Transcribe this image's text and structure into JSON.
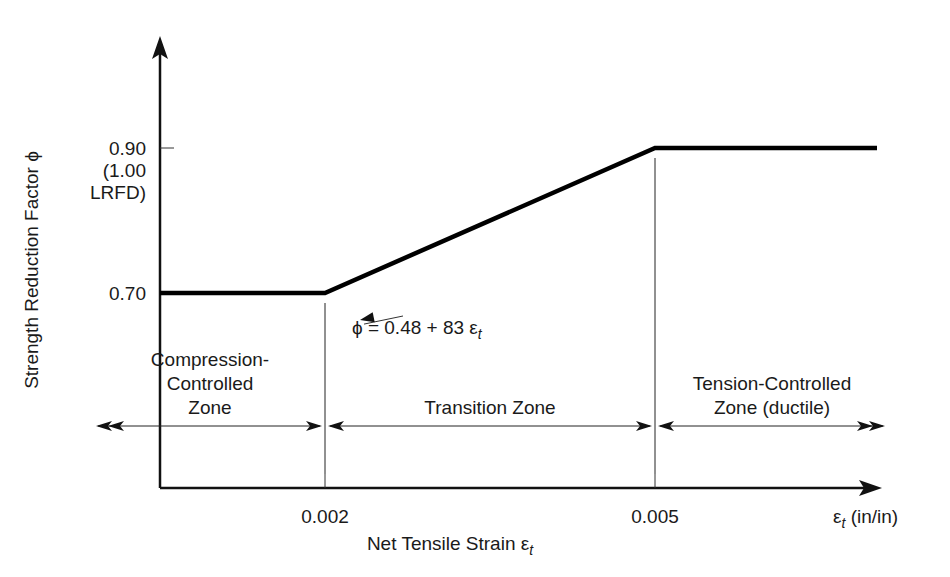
{
  "chart_data": {
    "type": "line",
    "title": "",
    "xlabel": "Net Tensile Strain ε",
    "xlabel_sub": "t",
    "x_axis_end_label": "ε",
    "x_axis_end_sub": "t",
    "x_axis_end_unit": " (in/in)",
    "ylabel": "Strength Reduction Factor ϕ",
    "xlim": [
      0,
      0.00675
    ],
    "ylim": [
      0.48,
      1.12
    ],
    "x_ticks": [
      {
        "value": 0.002,
        "label": "0.002"
      },
      {
        "value": 0.005,
        "label": "0.005"
      }
    ],
    "y_ticks": [
      {
        "value": 0.7,
        "label_lines": [
          "0.70"
        ]
      },
      {
        "value": 0.9,
        "label_lines": [
          "0.90",
          "(1.00",
          "LRFD)"
        ]
      }
    ],
    "series": [
      {
        "name": "Strength reduction factor",
        "x": [
          0.0,
          0.002,
          0.005,
          0.0067
        ],
        "y": [
          0.7,
          0.7,
          0.9,
          0.9
        ]
      }
    ],
    "annotation": {
      "text": "ϕ = 0.48 + 83 ε",
      "sub": "t",
      "points_to_x": 0.0023
    },
    "zones": [
      {
        "label_lines": [
          "Compression-",
          "Controlled",
          "Zone"
        ],
        "from": null,
        "to": 0.002
      },
      {
        "label_lines": [
          "Transition Zone"
        ],
        "from": 0.002,
        "to": 0.005
      },
      {
        "label_lines": [
          "Tension-Controlled",
          "Zone (ductile)"
        ],
        "from": 0.005,
        "to": null
      }
    ],
    "grid": false,
    "legend": "none"
  }
}
